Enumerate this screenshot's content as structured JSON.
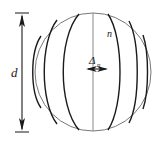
{
  "figure": {
    "type": "geometry-diagram",
    "background_color": "#ffffff",
    "stroke_color": "#1a1a1a",
    "outline_color": "#6b6b6b",
    "labels": {
      "diameter": "d",
      "zone_index": "n",
      "zone_width_symbol": "Δ",
      "zone_width_subscript": "n"
    },
    "dimension_line": {
      "name": "diameter-dimension",
      "orientation": "vertical",
      "x": 22,
      "y_top": 13,
      "y_bottom": 131,
      "tick_half_width": 7,
      "arrowheads": "both-ends-outward",
      "label": "d",
      "label_x": 14,
      "label_y": 72
    },
    "zone_width_marker": {
      "name": "zone-width-dimension",
      "orientation": "horizontal",
      "x_left": 86,
      "x_right": 108,
      "y": 69,
      "arrowheads": "both-ends-outward",
      "label_x": 92,
      "label_y": 62
    },
    "sphere": {
      "name": "sphere-outline",
      "center_x": 93,
      "center_y": 72,
      "radius_x": 58,
      "radius_y": 59
    },
    "zone_index_label": {
      "x": 111,
      "y": 34
    },
    "meridians": [
      {
        "id": "m1",
        "offset": -52,
        "curvature": 0.3
      },
      {
        "id": "m2",
        "offset": -36,
        "curvature": 0.52
      },
      {
        "id": "m3",
        "offset": -14,
        "curvature": 0.74
      },
      {
        "id": "m4",
        "offset": 0,
        "curvature": 1.0
      },
      {
        "id": "m5",
        "offset": 15,
        "curvature": 0.86
      },
      {
        "id": "m6",
        "offset": 36,
        "curvature": 0.62
      },
      {
        "id": "m7",
        "offset": 50,
        "curvature": 0.34
      }
    ]
  }
}
